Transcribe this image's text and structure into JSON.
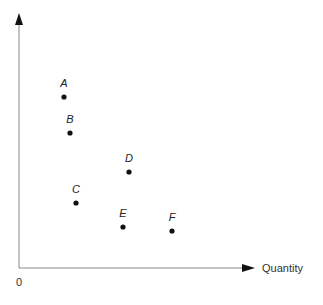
{
  "chart_data": {
    "type": "scatter",
    "title": "",
    "xlabel": "Quantity",
    "ylabel": "",
    "origin_label": "0",
    "grid": false,
    "points": [
      {
        "label": "A",
        "px": 64,
        "py": 97
      },
      {
        "label": "B",
        "px": 70,
        "py": 133
      },
      {
        "label": "C",
        "px": 76,
        "py": 203
      },
      {
        "label": "D",
        "px": 129,
        "py": 172
      },
      {
        "label": "E",
        "px": 123,
        "py": 227
      },
      {
        "label": "F",
        "px": 172,
        "py": 231
      }
    ]
  },
  "colors": {
    "axis": "#888888",
    "point": "#111111"
  }
}
